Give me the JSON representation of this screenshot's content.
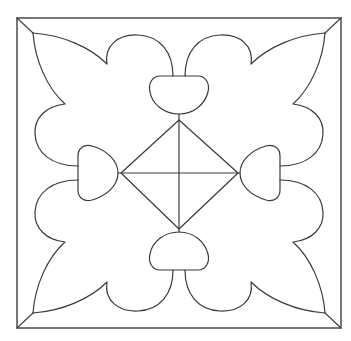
{
  "artwork": {
    "title": "Ornamental tile line drawing",
    "style": {
      "background": "#ffffff",
      "line_color": "#3a3a3a",
      "frame_color": "#555555",
      "line_width": 1.2,
      "frame_width": 1.6
    },
    "frame": {
      "x": 17,
      "y": 18,
      "width": 324,
      "height": 310
    },
    "center": {
      "x": 179,
      "y": 173
    },
    "elements": {
      "corner_leaves": [
        "top-left",
        "top-right",
        "bottom-left",
        "bottom-right"
      ],
      "center_lobes": [
        "top",
        "right",
        "bottom",
        "left"
      ],
      "diamond": {
        "top": [
          179,
          120
        ],
        "right": [
          238,
          173
        ],
        "bottom": [
          179,
          229
        ],
        "left": [
          121,
          173
        ]
      }
    }
  }
}
